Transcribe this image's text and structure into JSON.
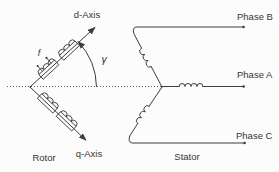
{
  "colors": {
    "background": "#fcfcfc",
    "line": "#3d3d3d",
    "text": "#353535"
  },
  "rotor": {
    "label": "Rotor",
    "d_axis_label": "d-Axis",
    "q_axis_label": "q-Axis",
    "field_winding_label": "f",
    "rotor_angle_label": "γ"
  },
  "stator": {
    "label": "Stator",
    "phase_b_label": "Phase B",
    "phase_a_label": "Phase A",
    "phase_c_label": "Phase C"
  }
}
